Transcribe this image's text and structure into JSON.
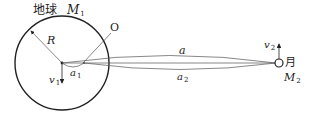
{
  "diagram": {
    "earth": {
      "label": "地球",
      "mass_symbol": "M",
      "mass_sub": "1",
      "radius_label": "R"
    },
    "moon": {
      "label": "月",
      "mass_symbol": "M",
      "mass_sub": "2"
    },
    "point_O": "O",
    "distances": {
      "a": "a",
      "a1_symbol": "a",
      "a1_sub": "1",
      "a2_symbol": "a",
      "a2_sub": "2"
    },
    "velocities": {
      "v1_symbol": "v",
      "v1_sub": "1",
      "v2_symbol": "v",
      "v2_sub": "2"
    },
    "colors": {
      "stroke": "#222222",
      "thin": "#555555"
    }
  }
}
